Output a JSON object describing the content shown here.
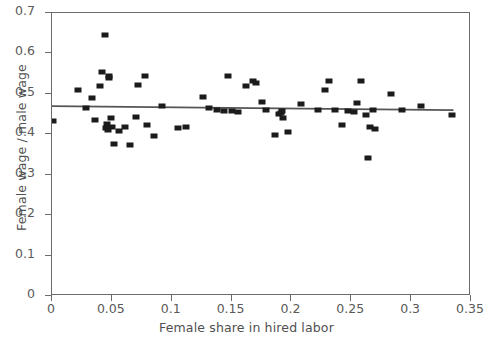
{
  "chart_data": {
    "type": "scatter",
    "title": "",
    "xlabel": "Female share in hired labor",
    "ylabel": "Female wage / male wage",
    "xlim": [
      0,
      0.35
    ],
    "ylim": [
      0,
      0.7
    ],
    "xticks": [
      "0",
      "0.05",
      "0.1",
      "0.15",
      "0.2",
      "0.25",
      "0.3",
      "0.35"
    ],
    "xtick_values": [
      0,
      0.05,
      0.1,
      0.15,
      0.2,
      0.25,
      0.3,
      0.35
    ],
    "yticks": [
      "0",
      "0.1",
      "0.2",
      "0.3",
      "0.4",
      "0.5",
      "0.6",
      "0.7"
    ],
    "ytick_values": [
      0,
      0.1,
      0.2,
      0.3,
      0.4,
      0.5,
      0.6,
      0.7
    ],
    "grid": false,
    "legend": null,
    "marker": "square",
    "marker_color": "#1b1b1b",
    "frame_color": "#6b6b6b",
    "series": [
      {
        "name": "observations",
        "points": [
          [
            0.001,
            0.434
          ],
          [
            0.022,
            0.509
          ],
          [
            0.028,
            0.466
          ],
          [
            0.033,
            0.49
          ],
          [
            0.036,
            0.436
          ],
          [
            0.04,
            0.519
          ],
          [
            0.042,
            0.555
          ],
          [
            0.044,
            0.645
          ],
          [
            0.045,
            0.416
          ],
          [
            0.046,
            0.425
          ],
          [
            0.047,
            0.41
          ],
          [
            0.048,
            0.543
          ],
          [
            0.048,
            0.538
          ],
          [
            0.049,
            0.44
          ],
          [
            0.05,
            0.419
          ],
          [
            0.052,
            0.377
          ],
          [
            0.056,
            0.408
          ],
          [
            0.061,
            0.418
          ],
          [
            0.065,
            0.373
          ],
          [
            0.07,
            0.443
          ],
          [
            0.072,
            0.521
          ],
          [
            0.078,
            0.545
          ],
          [
            0.079,
            0.422
          ],
          [
            0.085,
            0.396
          ],
          [
            0.092,
            0.47
          ],
          [
            0.105,
            0.416
          ],
          [
            0.112,
            0.418
          ],
          [
            0.126,
            0.491
          ],
          [
            0.131,
            0.466
          ],
          [
            0.138,
            0.459
          ],
          [
            0.144,
            0.458
          ],
          [
            0.147,
            0.545
          ],
          [
            0.15,
            0.457
          ],
          [
            0.155,
            0.455
          ],
          [
            0.162,
            0.519
          ],
          [
            0.168,
            0.531
          ],
          [
            0.17,
            0.527
          ],
          [
            0.175,
            0.48
          ],
          [
            0.179,
            0.459
          ],
          [
            0.186,
            0.399
          ],
          [
            0.19,
            0.449
          ],
          [
            0.191,
            0.452
          ],
          [
            0.192,
            0.458
          ],
          [
            0.193,
            0.441
          ],
          [
            0.197,
            0.406
          ],
          [
            0.208,
            0.474
          ],
          [
            0.222,
            0.46
          ],
          [
            0.228,
            0.509
          ],
          [
            0.231,
            0.532
          ],
          [
            0.236,
            0.459
          ],
          [
            0.242,
            0.424
          ],
          [
            0.247,
            0.457
          ],
          [
            0.252,
            0.456
          ],
          [
            0.255,
            0.478
          ],
          [
            0.258,
            0.533
          ],
          [
            0.262,
            0.448
          ],
          [
            0.264,
            0.341
          ],
          [
            0.266,
            0.419
          ],
          [
            0.268,
            0.459
          ],
          [
            0.27,
            0.412
          ],
          [
            0.283,
            0.499
          ],
          [
            0.292,
            0.459
          ],
          [
            0.308,
            0.471
          ],
          [
            0.334,
            0.448
          ]
        ]
      }
    ],
    "trendline": {
      "x_start": 0.0,
      "y_start": 0.468,
      "x_end": 0.337,
      "y_end": 0.458,
      "color": "#555555"
    }
  }
}
